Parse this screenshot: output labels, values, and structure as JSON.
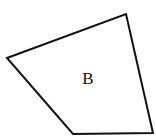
{
  "diagram": {
    "shape": "quadrilateral",
    "label": "B",
    "stroke_color": "#111111",
    "fill_color": "#ffffff",
    "vertices": [
      [
        7,
        58
      ],
      [
        126,
        14
      ],
      [
        153,
        133
      ],
      [
        73,
        134
      ]
    ],
    "label_position": [
      88,
      78
    ]
  }
}
